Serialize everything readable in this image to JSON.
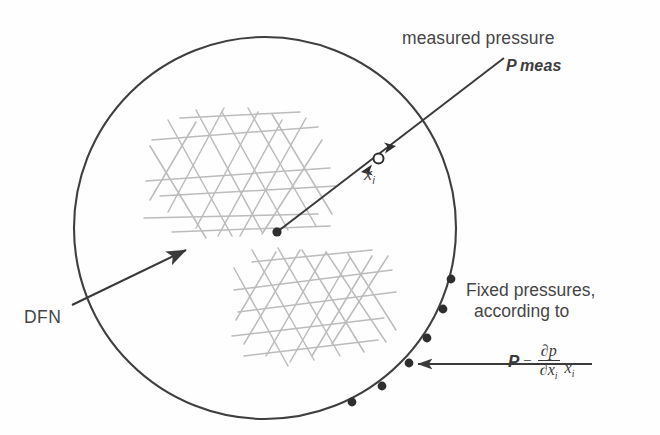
{
  "figure": {
    "domain_shape": "circle",
    "colors": {
      "boundary": "#3f3f3f",
      "fracture": "#b9b9b9",
      "arrow": "#3a3a3a",
      "text": "#464646",
      "marker_fill": "#2e2e2e",
      "marker_hollow": "#ffffff",
      "background": "#ffffff"
    }
  },
  "labels": {
    "measured_pressure": "measured pressure",
    "p_meas_symbol": "P",
    "p_meas_subscript": "meas",
    "x_i_symbol": "x",
    "x_i_subscript": "i",
    "dfn": "DFN",
    "fixed_pressures_line1": "Fixed pressures,",
    "fixed_pressures_line2": "according to"
  },
  "formula": {
    "lhs": "P",
    "equals": "=",
    "numerator": "∂p",
    "denominator_base": "∂x",
    "denominator_sub": "i",
    "multiplier_base": "x",
    "multiplier_sub": "i",
    "plain_text": "P = (∂p/∂x_i) x_i"
  },
  "geometry": {
    "circle": {
      "cx": 265,
      "cy": 228,
      "r": 191
    },
    "measurement_point": {
      "x": 378,
      "y": 158,
      "marker": "hollow-circle"
    },
    "source_point": {
      "x": 277,
      "y": 232,
      "marker": "filled-dot"
    },
    "pointer_line": {
      "x1": 277,
      "y1": 232,
      "x2": 504,
      "y2": 58
    },
    "dfn_arrow": {
      "x1": 74,
      "y1": 303,
      "x2": 190,
      "y2": 247
    },
    "fixed_arrow": {
      "x1": 588,
      "y1": 364,
      "x2": 412,
      "y2": 364
    },
    "boundary_dots": [
      {
        "x": 451,
        "y": 279
      },
      {
        "x": 443,
        "y": 309
      },
      {
        "x": 427,
        "y": 338
      },
      {
        "x": 409,
        "y": 363
      },
      {
        "x": 382,
        "y": 386
      },
      {
        "x": 352,
        "y": 402
      }
    ]
  },
  "fracture_networks": [
    {
      "name": "upper-cluster",
      "bbox": {
        "x": 145,
        "y": 100,
        "w": 195,
        "h": 135
      },
      "orientations_deg": [
        0,
        62,
        -62
      ]
    },
    {
      "name": "lower-cluster",
      "bbox": {
        "x": 232,
        "y": 246,
        "w": 175,
        "h": 128
      },
      "orientations_deg": [
        0,
        62,
        -62
      ]
    }
  ]
}
